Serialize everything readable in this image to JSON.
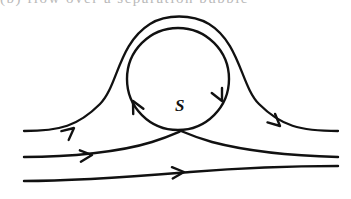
{
  "figure": {
    "type": "streamline-diagram",
    "width": 351,
    "height": 199,
    "background_color": "#ffffff",
    "stroke_color": "#111111",
    "cropped_caption_text": "(b)   flow over a separation bubble",
    "labels": {
      "saddle_point": "S"
    },
    "elements": {
      "outer_separatrix_name": "outer-separatrix",
      "recirculation_circle_name": "recirculation-vortex",
      "middle_streamline_name": "middle-streamline",
      "lower_streamline_name": "lower-streamline"
    },
    "annotations": {
      "vortex_rotation": "clockwise",
      "freestream_direction": "left-to-right",
      "saddle_point_x": 181,
      "saddle_point_y": 131
    }
  },
  "geometry": {
    "circle": {
      "cx": 178,
      "cy": 79,
      "r": 51
    },
    "stroke_widths": {
      "separatrix": 2.3,
      "circle": 2.4,
      "streamline": 2.4
    },
    "paths": {
      "outer_separatrix": "M 24,131 C 60,131 78,126 100,104 C 118,86 118,44 150,24 C 166,14 192,14 209,24 C 240,43 241,86 259,104 C 281,126 300,131 338,131",
      "vortex_circle": "M 178,28 C 206.2,28 229,50.8 229,79 C 229,107.2 206.2,130 178,130 C 149.8,130 127,107.2 127,79 C 127,50.8 149.8,28 178,28 Z",
      "middle_streamline": "M 24,157 C 70,157 120,152 152,142 C 166,137.6 174,134 181,131 C 189,134.4 198,138 212,142 C 250,152 300,156 338,157",
      "lower_streamline": "M 24,181 C 80,181 140,176 190,172 C 240,168 300,166 338,166"
    },
    "arrow_heads": [
      {
        "name": "arrowhead-separatrix-left",
        "x": 74,
        "y": 128,
        "angle": -40
      },
      {
        "name": "arrowhead-separatrix-right",
        "x": 280,
        "y": 126,
        "angle": 42
      },
      {
        "name": "arrowhead-vortex-left",
        "x": 133,
        "y": 101,
        "angle": -117
      },
      {
        "name": "arrowhead-vortex-right",
        "x": 222,
        "y": 101,
        "angle": 64
      },
      {
        "name": "arrowhead-middle-streamline",
        "x": 92,
        "y": 155,
        "angle": -5
      },
      {
        "name": "arrowhead-lower-streamline",
        "x": 184,
        "y": 172,
        "angle": -4
      }
    ]
  }
}
